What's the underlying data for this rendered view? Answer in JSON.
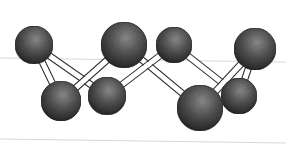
{
  "illustration": {
    "subject": "ball-and-stick molecular chain (zig-zag lattice of spheres connected by double rods)",
    "background": "#ffffff",
    "sphere_color_dark": "#1e1e1e",
    "sphere_color_mid": "#5a5a5a",
    "sphere_color_light": "#9a9a9a",
    "rod_color": "#ffffff",
    "rod_outline": "#333333",
    "guide_line_color": "#d8d8d8",
    "spheres": [
      {
        "id": "s1",
        "cx": 34,
        "cy": 45,
        "r": 19
      },
      {
        "id": "s2",
        "cx": 61,
        "cy": 101,
        "r": 20
      },
      {
        "id": "s3",
        "cx": 124,
        "cy": 45,
        "r": 23
      },
      {
        "id": "s4",
        "cx": 107,
        "cy": 96,
        "r": 19
      },
      {
        "id": "s5",
        "cx": 174,
        "cy": 45,
        "r": 18
      },
      {
        "id": "s6",
        "cx": 200,
        "cy": 108,
        "r": 23
      },
      {
        "id": "s7",
        "cx": 255,
        "cy": 49,
        "r": 21
      },
      {
        "id": "s8",
        "cx": 239,
        "cy": 96,
        "r": 18
      }
    ],
    "bonds": [
      {
        "from": "s1",
        "to": "s2"
      },
      {
        "from": "s1",
        "to": "s4"
      },
      {
        "from": "s2",
        "to": "s3"
      },
      {
        "from": "s3",
        "to": "s6"
      },
      {
        "from": "s4",
        "to": "s5"
      },
      {
        "from": "s5",
        "to": "s8"
      },
      {
        "from": "s6",
        "to": "s7"
      },
      {
        "from": "s7",
        "to": "s8"
      }
    ],
    "guide_lines": [
      {
        "y1": 58,
        "y2": 62
      },
      {
        "y1": 139,
        "y2": 143
      }
    ]
  }
}
